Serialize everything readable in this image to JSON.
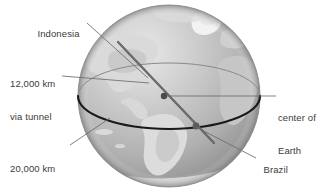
{
  "figure": {
    "background_color": "#ffffff",
    "globe": {
      "center_x": 169,
      "center_y": 96,
      "radius": 91,
      "ocean_color": "#b5b5b5",
      "land_color": "#d4d4d4",
      "highlight_color": "#e2e2e2",
      "shadow_color": "#8e8e8e"
    },
    "equator": {
      "name": "equator-circle",
      "rx": 91,
      "ry": 33,
      "color": "#1a1a1a",
      "back_color": "#808080"
    },
    "tunnel_line": {
      "name": "tunnel-line",
      "color": "#55555a"
    },
    "points": [
      {
        "id": "center-of-earth",
        "x": 164,
        "y": 96,
        "color": "#4a4a4a",
        "r": 3.2
      },
      {
        "id": "brazil",
        "x": 196,
        "y": 126,
        "color": "#5a5a5a",
        "r": 3.4
      }
    ],
    "leader_color": "#6b6b6b"
  },
  "labels": {
    "indonesia": "Indonesia",
    "tunnel_line1": "12,000 km",
    "tunnel_line2": "via tunnel",
    "circle_line1": "20,000 km",
    "circle_line2": "via circle",
    "center_line1": "center of",
    "center_line2": "Earth",
    "brazil": "Brazil"
  }
}
